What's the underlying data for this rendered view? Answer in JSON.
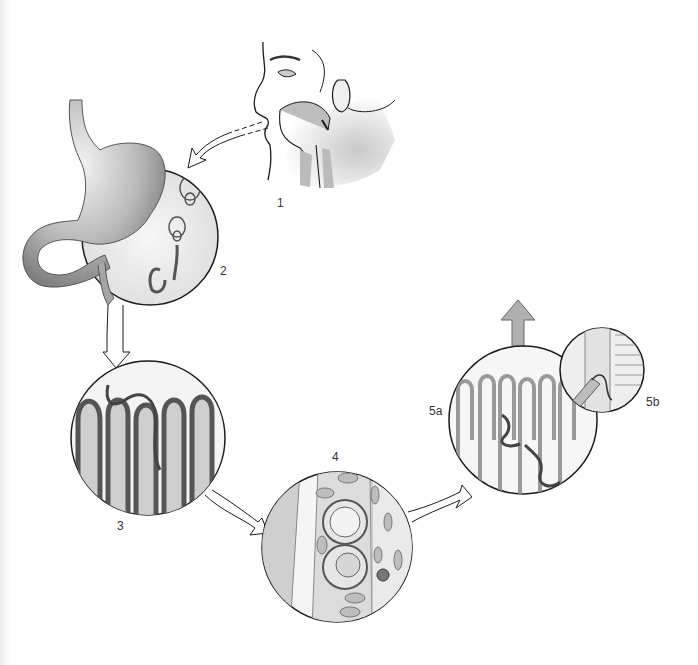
{
  "diagram": {
    "type": "life-cycle",
    "stages": [
      {
        "id": "1",
        "label": "1",
        "depicts": "human head profile ingesting (mouth and throat)"
      },
      {
        "id": "2",
        "label": "2",
        "depicts": "stomach with coiled larvae"
      },
      {
        "id": "3",
        "label": "3",
        "depicts": "intestinal villi with worm"
      },
      {
        "id": "4",
        "label": "4",
        "depicts": "tissue section with encysted eggs/larvae"
      },
      {
        "id": "5a",
        "label": "5a",
        "depicts": "intestinal villi with worms"
      },
      {
        "id": "5b",
        "label": "5b",
        "depicts": "inset: larva entering blood vessel"
      }
    ],
    "arrows": [
      {
        "from": "1",
        "to": "2",
        "style": "outline"
      },
      {
        "from": "2",
        "to": "3",
        "style": "outline"
      },
      {
        "from": "3",
        "to": "4",
        "style": "outline"
      },
      {
        "from": "4",
        "to": "5a",
        "style": "outline"
      },
      {
        "from": "5a",
        "to": "exit",
        "style": "filled-gray",
        "direction": "up"
      }
    ],
    "colors": {
      "outline": "#1a1a1a",
      "tissue": "#8a8a8a",
      "light_fill": "#e8e8e8",
      "exit_arrow": "#b0b0b0"
    }
  }
}
